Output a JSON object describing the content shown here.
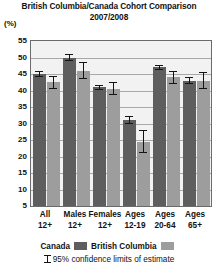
{
  "chart_data": {
    "type": "bar",
    "title": "British Columbia/Canada Cohort Comparison",
    "subtitle": "2007/2008",
    "ylabel": "(%)",
    "xlabel": "",
    "ylim": [
      5,
      55
    ],
    "yticks": [
      55,
      50,
      45,
      40,
      35,
      30,
      25,
      20,
      15,
      10,
      5
    ],
    "grid": true,
    "legend_position": "bottom",
    "categories": [
      "All 12+",
      "Males 12+",
      "Females 12+",
      "Ages 12-19",
      "Ages 20-64",
      "Ages 65+"
    ],
    "category_lines": [
      [
        "All",
        "12+"
      ],
      [
        "Males",
        "12+"
      ],
      [
        "Females",
        "12+"
      ],
      [
        "Ages",
        "12-19"
      ],
      [
        "Ages",
        "20-64"
      ],
      [
        "Ages",
        "65+"
      ]
    ],
    "series": [
      {
        "name": "Canada",
        "color": "#5e5e5e",
        "values": [
          45.0,
          50.0,
          41.0,
          31.0,
          47.0,
          43.0
        ],
        "ci_low": [
          44.2,
          49.0,
          40.2,
          29.8,
          46.2,
          42.0
        ],
        "ci_high": [
          45.8,
          51.0,
          41.8,
          32.2,
          47.8,
          44.0
        ]
      },
      {
        "name": "British Columbia",
        "color": "#9d9d9d",
        "values": [
          42.5,
          46.0,
          40.5,
          24.5,
          44.0,
          43.0
        ],
        "ci_low": [
          40.5,
          43.5,
          38.5,
          21.0,
          42.0,
          40.5
        ],
        "ci_high": [
          44.5,
          48.5,
          42.5,
          28.0,
          46.0,
          45.5
        ]
      }
    ],
    "annotation": "95% confidence limits of estimate",
    "annotation_prefix": "",
    "plot_bg": "#f2f2f2",
    "grid_color": "#a8a8a8",
    "frame_color": "#6b6b6b"
  },
  "legend": {
    "canada_label": "Canada",
    "bc_label": "British Columbia",
    "ci_note": "95% confidence limits of estimate"
  }
}
